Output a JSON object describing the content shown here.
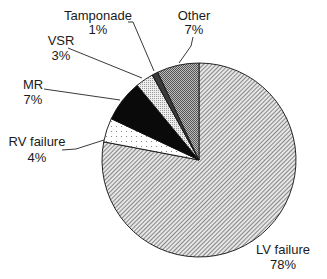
{
  "chart_data": {
    "type": "pie",
    "title": "",
    "start_angle_deg": 0,
    "direction": "clockwise",
    "slices": [
      {
        "label": "LV failure",
        "value": 78,
        "pct_label": "78%",
        "pattern": "diagonal-hatch"
      },
      {
        "label": "RV failure",
        "value": 4,
        "pct_label": "4%",
        "pattern": "sparse-dots"
      },
      {
        "label": "MR",
        "value": 7,
        "pct_label": "7%",
        "pattern": "solid-black"
      },
      {
        "label": "VSR",
        "value": 3,
        "pct_label": "3%",
        "pattern": "light-dots"
      },
      {
        "label": "Tamponade",
        "value": 1,
        "pct_label": "1%",
        "pattern": "dark-gray"
      },
      {
        "label": "Other",
        "value": 7,
        "pct_label": "7%",
        "pattern": "checker-gray"
      }
    ],
    "categories": [
      "LV failure",
      "RV failure",
      "MR",
      "VSR",
      "Tamponade",
      "Other"
    ],
    "values": [
      78,
      4,
      7,
      3,
      1,
      7
    ],
    "legend": "none (leader-line labels)"
  },
  "labels": {
    "lv": {
      "name": "LV failure",
      "pct": "78%"
    },
    "rv": {
      "name": "RV failure",
      "pct": "4%"
    },
    "mr": {
      "name": "MR",
      "pct": "7%"
    },
    "vsr": {
      "name": "VSR",
      "pct": "3%"
    },
    "tamponade": {
      "name": "Tamponade",
      "pct": "1%"
    },
    "other": {
      "name": "Other",
      "pct": "7%"
    }
  }
}
